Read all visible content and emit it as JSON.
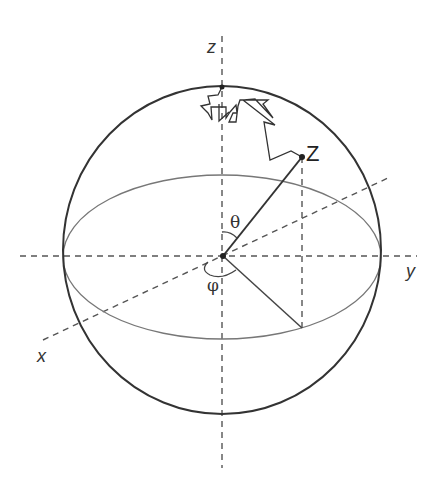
{
  "diagram": {
    "colors": {
      "sphere": "#333333",
      "equator": "#777777",
      "axes": "#555555",
      "vector": "#333333",
      "path": "#333333"
    },
    "labels": {
      "z_axis": "z",
      "x_axis": "x",
      "y_axis": "y",
      "point": "Z",
      "theta": "θ",
      "phi": "φ"
    }
  }
}
